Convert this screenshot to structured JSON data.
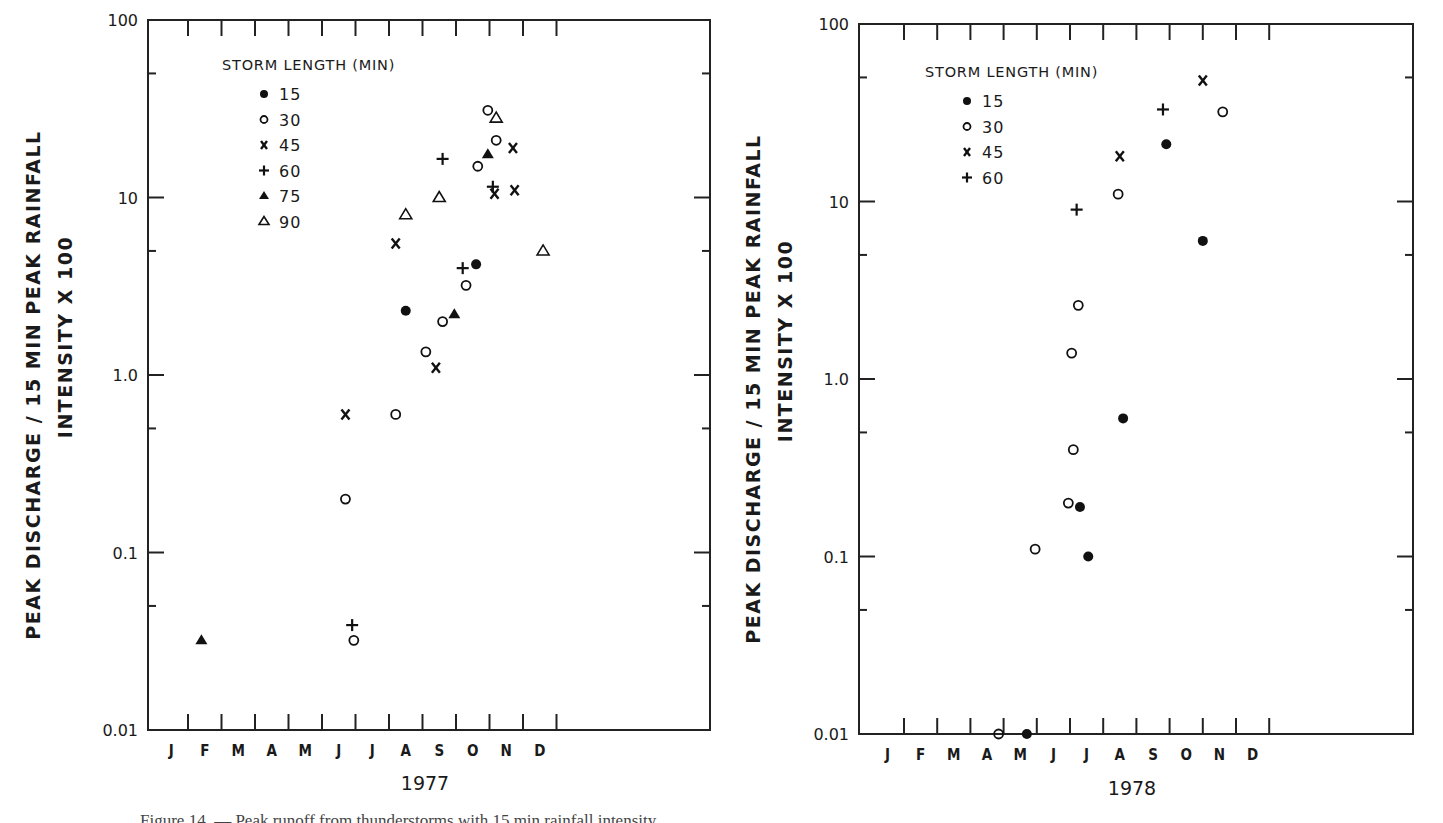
{
  "figure": {
    "caption_partial": "Figure 14. — Peak runoff from thunderstorms with 15 min rainfall intensity"
  },
  "legend_title": "STORM LENGTH (MIN)",
  "ylabel_line1": "PEAK DISCHARGE / 15 MIN PEAK RAINFALL",
  "ylabel_line2": "INTENSITY X 100",
  "chart_data": [
    {
      "type": "scatter",
      "title": "1977",
      "xlabel": "1977",
      "ylabel": "PEAK DISCHARGE / 15 MIN PEAK RAINFALL INTENSITY X 100",
      "yscale": "log",
      "ylim": [
        0.01,
        100
      ],
      "yticks": [
        "0.01",
        "0.1",
        "1.0",
        "10",
        "100"
      ],
      "categories": [
        "J",
        "F",
        "M",
        "A",
        "M",
        "J",
        "J",
        "A",
        "S",
        "O",
        "N",
        "D"
      ],
      "legend": {
        "title": "STORM LENGTH (MIN)",
        "position": "upper-left",
        "entries": [
          {
            "label": "15",
            "marker": "filled-circle"
          },
          {
            "label": "30",
            "marker": "open-circle"
          },
          {
            "label": "45",
            "marker": "x"
          },
          {
            "label": "60",
            "marker": "plus"
          },
          {
            "label": "75",
            "marker": "filled-triangle"
          },
          {
            "label": "90",
            "marker": "open-triangle"
          }
        ]
      },
      "grid": false,
      "series": [
        {
          "name": "15",
          "marker": "filled-circle",
          "points": [
            {
              "month": 7.5,
              "y": 2.3
            },
            {
              "month": 9.6,
              "y": 4.2
            }
          ]
        },
        {
          "name": "30",
          "marker": "open-circle",
          "points": [
            {
              "month": 5.7,
              "y": 0.2
            },
            {
              "month": 5.95,
              "y": 0.032
            },
            {
              "month": 7.2,
              "y": 0.6
            },
            {
              "month": 8.1,
              "y": 1.35
            },
            {
              "month": 8.6,
              "y": 2.0
            },
            {
              "month": 9.3,
              "y": 3.2
            },
            {
              "month": 9.65,
              "y": 15
            },
            {
              "month": 9.95,
              "y": 31
            },
            {
              "month": 10.2,
              "y": 21
            }
          ]
        },
        {
          "name": "45",
          "marker": "x",
          "points": [
            {
              "month": 5.7,
              "y": 0.6
            },
            {
              "month": 7.2,
              "y": 5.5
            },
            {
              "month": 8.4,
              "y": 1.1
            },
            {
              "month": 10.15,
              "y": 10.5
            },
            {
              "month": 10.7,
              "y": 19
            },
            {
              "month": 10.75,
              "y": 11
            }
          ]
        },
        {
          "name": "60",
          "marker": "plus",
          "points": [
            {
              "month": 5.9,
              "y": 0.039
            },
            {
              "month": 8.6,
              "y": 16.5
            },
            {
              "month": 9.2,
              "y": 4.0
            },
            {
              "month": 10.1,
              "y": 11.5
            }
          ]
        },
        {
          "name": "75",
          "marker": "filled-triangle",
          "points": [
            {
              "month": 1.4,
              "y": 0.032
            },
            {
              "month": 8.95,
              "y": 2.2
            },
            {
              "month": 9.95,
              "y": 17.5
            }
          ]
        },
        {
          "name": "90",
          "marker": "open-triangle",
          "points": [
            {
              "month": 7.5,
              "y": 8.0
            },
            {
              "month": 8.5,
              "y": 10
            },
            {
              "month": 10.2,
              "y": 28
            },
            {
              "month": 11.6,
              "y": 5.0
            }
          ]
        }
      ]
    },
    {
      "type": "scatter",
      "title": "1978",
      "xlabel": "1978",
      "ylabel": "PEAK DISCHARGE / 15 MIN PEAK RAINFALL INTENSITY X 100",
      "yscale": "log",
      "ylim": [
        0.01,
        100
      ],
      "yticks": [
        "0.01",
        "0.1",
        "1.0",
        "10",
        "100"
      ],
      "categories": [
        "J",
        "F",
        "M",
        "A",
        "M",
        "J",
        "J",
        "A",
        "S",
        "O",
        "N",
        "D"
      ],
      "legend": {
        "title": "STORM LENGTH (MIN)",
        "position": "upper-left",
        "entries": [
          {
            "label": "15",
            "marker": "filled-circle"
          },
          {
            "label": "30",
            "marker": "open-circle"
          },
          {
            "label": "45",
            "marker": "x"
          },
          {
            "label": "60",
            "marker": "plus"
          }
        ]
      },
      "grid": false,
      "series": [
        {
          "name": "15",
          "marker": "filled-circle",
          "points": [
            {
              "month": 4.7,
              "y": 0.01
            },
            {
              "month": 6.3,
              "y": 0.19
            },
            {
              "month": 6.55,
              "y": 0.1
            },
            {
              "month": 7.6,
              "y": 0.6
            },
            {
              "month": 8.9,
              "y": 21
            },
            {
              "month": 10.0,
              "y": 6.0
            }
          ]
        },
        {
          "name": "30",
          "marker": "open-circle",
          "points": [
            {
              "month": 3.85,
              "y": 0.01
            },
            {
              "month": 4.95,
              "y": 0.11
            },
            {
              "month": 5.95,
              "y": 0.2
            },
            {
              "month": 6.1,
              "y": 0.4
            },
            {
              "month": 6.05,
              "y": 1.4
            },
            {
              "month": 6.25,
              "y": 2.6
            },
            {
              "month": 7.45,
              "y": 11
            },
            {
              "month": 10.6,
              "y": 32
            }
          ]
        },
        {
          "name": "45",
          "marker": "x",
          "points": [
            {
              "month": 7.5,
              "y": 18
            },
            {
              "month": 10.0,
              "y": 48
            }
          ]
        },
        {
          "name": "60",
          "marker": "plus",
          "points": [
            {
              "month": 6.2,
              "y": 9.0
            },
            {
              "month": 8.8,
              "y": 33
            }
          ]
        }
      ]
    }
  ]
}
